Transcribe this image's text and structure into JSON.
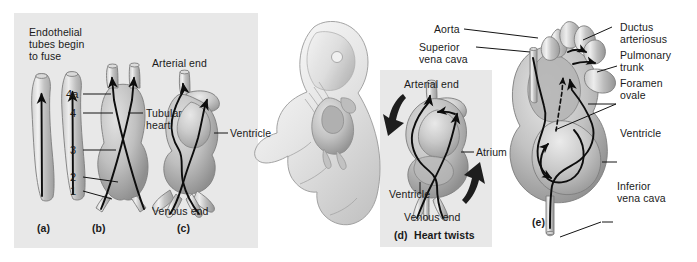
{
  "figure": {
    "background_color": "#ffffff",
    "panel_color": "#e8e8e8",
    "line_color": "#0d0d0d"
  },
  "panels": {
    "left": {
      "caption_a": "(a)",
      "caption_b": "(b)",
      "caption_c": "(c)",
      "heading": "Endothelial\ntubes begin\nto fuse",
      "heading_line1": "Endothelial",
      "heading_line2": "tubes begin",
      "heading_line3": "to fuse",
      "numbers": [
        "4a",
        "4",
        "3",
        "2",
        "1"
      ],
      "label_tubular_heart_line1": "Tubular",
      "label_tubular_heart_line2": "heart",
      "label_arterial_end": "Arterial end",
      "label_venous_end": "Venous end",
      "label_ventricle": "Ventricle"
    },
    "embryo": {
      "name": "embryo-illustration"
    },
    "twist": {
      "caption": "(d) Heart twists",
      "caption_id": "(d)",
      "caption_text": "Heart twists",
      "label_arterial_end": "Arterial end",
      "label_venous_end": "Venous end",
      "label_atrium": "Atrium",
      "label_ventricle": "Ventricle"
    },
    "fetal_heart": {
      "caption": "(e)",
      "label_aorta": "Aorta",
      "label_superior_vena_cava_line1": "Superior",
      "label_superior_vena_cava_line2": "vena cava",
      "label_inferior_vena_cava_line1": "Inferior",
      "label_inferior_vena_cava_line2": "vena cava",
      "label_ductus_arteriosus_line1": "Ductus",
      "label_ductus_arteriosus_line2": "arteriosus",
      "label_pulmonary_trunk_line1": "Pulmonary",
      "label_pulmonary_trunk_line2": "trunk",
      "label_foramen_ovale_line1": "Foramen",
      "label_foramen_ovale_line2": "ovale",
      "label_ventricle": "Ventricle"
    }
  }
}
